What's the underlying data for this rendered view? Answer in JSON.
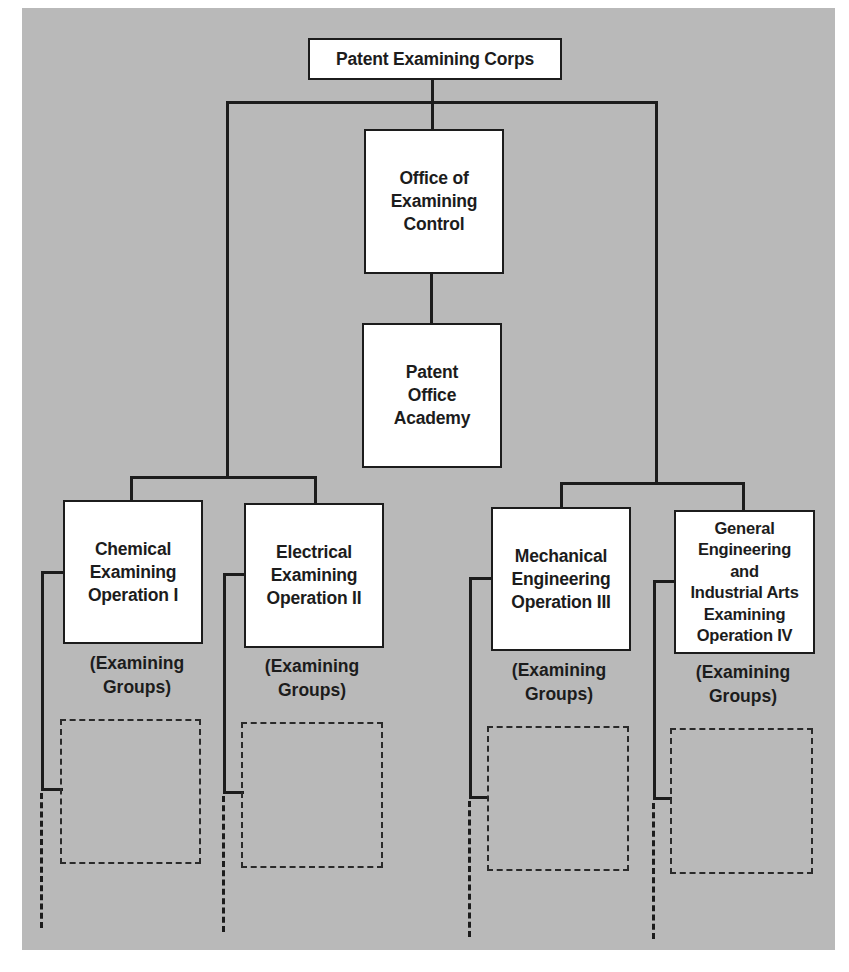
{
  "diagram": {
    "root": {
      "label": "Patent Examining Corps"
    },
    "staff": [
      {
        "label": "Office of\nExamining\nControl"
      },
      {
        "label": "Patent\nOffice\nAcademy"
      }
    ],
    "operations": [
      {
        "label": "Chemical\nExamining\nOperation I",
        "sub_label": "(Examining\nGroups)"
      },
      {
        "label": "Electrical\nExamining\nOperation II",
        "sub_label": "(Examining\nGroups)"
      },
      {
        "label": "Mechanical\nEngineering\nOperation III",
        "sub_label": "(Examining\nGroups)"
      },
      {
        "label": "General\nEngineering\nand\nIndustrial Arts\nExamining\nOperation IV",
        "sub_label": "(Examining\nGroups)"
      }
    ]
  },
  "colors": {
    "background": "#b9b9b9",
    "box_fill": "#ffffff",
    "line": "#1c1c1c"
  }
}
